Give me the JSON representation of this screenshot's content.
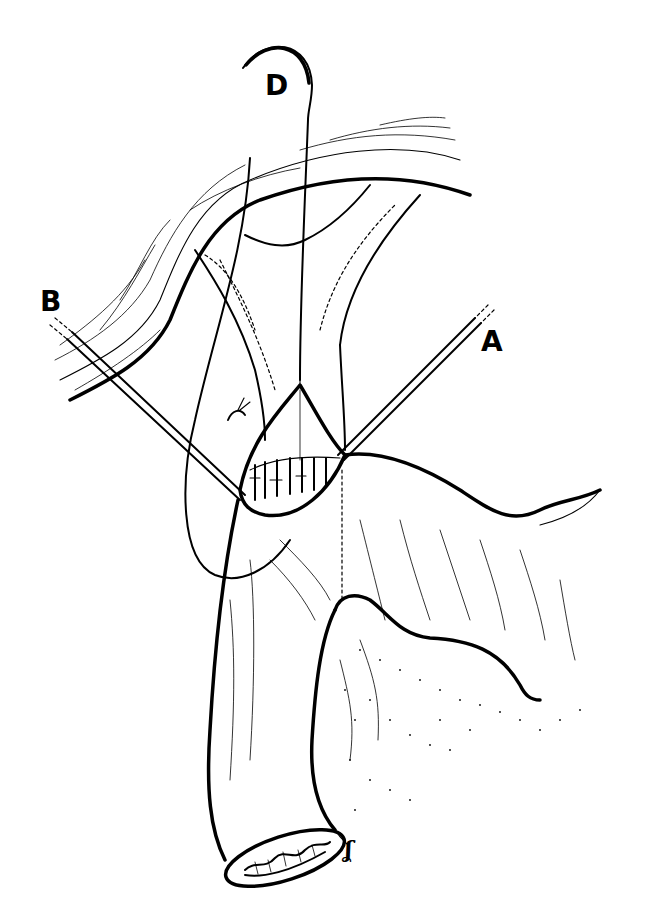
{
  "figure": {
    "type": "surgical line illustration",
    "background": "#ffffff",
    "ink": "#000000",
    "labels": {
      "D": "D",
      "B": "B",
      "A": "A"
    },
    "signature": "ʆ"
  }
}
